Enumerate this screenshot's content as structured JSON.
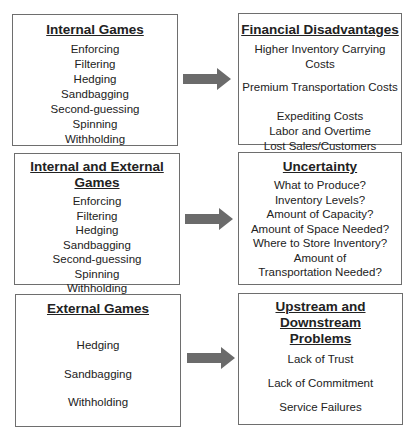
{
  "left_column": [
    {
      "title": "Internal Games",
      "items": [
        "Enforcing",
        "Filtering",
        "Hedging",
        "Sandbagging",
        "Second-guessing",
        "Spinning",
        "Withholding"
      ]
    },
    {
      "title": "Internal and External Games",
      "items": [
        "Enforcing",
        "Filtering",
        "Hedging",
        "Sandbagging",
        "Second-guessing",
        "Spinning",
        "Withholding"
      ]
    },
    {
      "title": "External Games",
      "items": [
        "Hedging",
        "Sandbagging",
        "Withholding"
      ]
    }
  ],
  "right_column": [
    {
      "title": "Financial Disadvantages",
      "items": [
        "Higher Inventory Carrying Costs",
        "Premium Transportation Costs",
        "Expediting Costs",
        "Labor and Overtime",
        "Lost Sales/Customers"
      ]
    },
    {
      "title": "Uncertainty",
      "items": [
        "What to Produce?",
        "Inventory Levels?",
        "Amount of Capacity?",
        "Amount of Space Needed?",
        "Where to Store Inventory?",
        "Amount of",
        "Transportation Needed?"
      ]
    },
    {
      "title_line1": "Upstream and Downstream",
      "title_line2": "Problems",
      "items": [
        "Lack of Trust",
        "Lack of Commitment",
        "Service Failures"
      ]
    }
  ],
  "colors": {
    "arrow": "#6b6b6b",
    "border": "#6e6e6e",
    "text": "#222222"
  }
}
